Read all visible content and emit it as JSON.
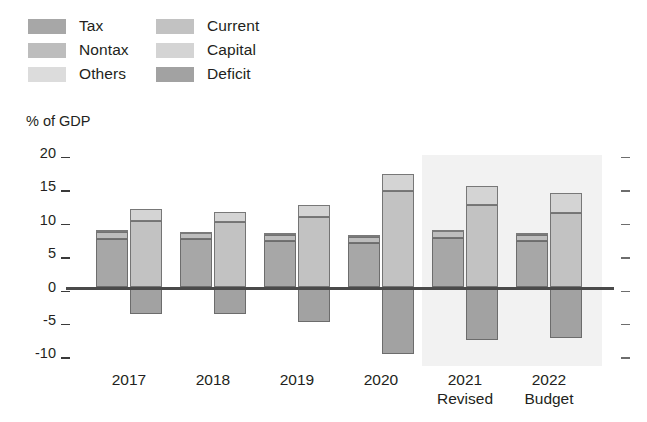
{
  "legend": {
    "columns": [
      {
        "items": [
          {
            "label": "Tax",
            "color": "#a7a7a7"
          },
          {
            "label": "Nontax",
            "color": "#bdbdbd"
          },
          {
            "label": "Others",
            "color": "#dcdcdc"
          }
        ]
      },
      {
        "items": [
          {
            "label": "Current",
            "color": "#c2c2c2"
          },
          {
            "label": "Capital",
            "color": "#d4d4d4"
          },
          {
            "label": "Deficit",
            "color": "#a2a2a2"
          }
        ]
      }
    ]
  },
  "axis_title": "% of GDP",
  "chart_data": {
    "type": "bar",
    "title": "",
    "xlabel": "",
    "ylabel": "% of GDP",
    "ylim": [
      -10,
      20
    ],
    "yticks": [
      20,
      15,
      10,
      5,
      0,
      -5,
      -10
    ],
    "ytick_labels": [
      "20",
      "15",
      "10",
      "5",
      "0",
      "-5",
      "-10"
    ],
    "grid": false,
    "legend_position": "top-left",
    "categories": [
      "2017",
      "2018",
      "2019",
      "2020",
      "2021",
      "2022"
    ],
    "category_sublabels": [
      "",
      "",
      "",
      "",
      "Revised",
      "Budget"
    ],
    "forecast_shaded_categories": [
      "2021",
      "2022"
    ],
    "series": [
      {
        "name": "Tax",
        "group": "revenue",
        "color": "#a7a7a7",
        "values": [
          7.3,
          7.2,
          6.9,
          6.6,
          7.4,
          7.0
        ]
      },
      {
        "name": "Nontax",
        "group": "revenue",
        "color": "#bdbdbd",
        "values": [
          1.0,
          0.9,
          0.9,
          1.0,
          1.0,
          0.9
        ]
      },
      {
        "name": "Others",
        "group": "revenue",
        "color": "#dcdcdc",
        "values": [
          0.3,
          0.2,
          0.3,
          0.2,
          0.2,
          0.2
        ]
      },
      {
        "name": "Current",
        "group": "expenditure",
        "color": "#c2c2c2",
        "values": [
          9.9,
          9.8,
          10.6,
          14.5,
          12.4,
          11.1
        ]
      },
      {
        "name": "Capital",
        "group": "expenditure",
        "color": "#d4d4d4",
        "values": [
          1.8,
          1.5,
          1.7,
          2.5,
          2.8,
          3.0
        ]
      },
      {
        "name": "Deficit",
        "group": "deficit",
        "color": "#a2a2a2",
        "values": [
          -3.9,
          -3.9,
          -5.2,
          -10.0,
          -7.8,
          -7.5
        ]
      }
    ],
    "totals": {
      "revenue": [
        8.6,
        8.3,
        8.1,
        7.8,
        8.6,
        8.1
      ],
      "expenditure": [
        11.7,
        11.3,
        12.3,
        17.0,
        15.2,
        14.1
      ],
      "deficit": [
        -3.9,
        -3.9,
        -5.2,
        -10.0,
        -7.8,
        -7.5
      ]
    }
  },
  "colors": {
    "forecast_band": "#f2f2f2",
    "zero_line": "#4a4a4a",
    "tick": "#3a3a3a",
    "text": "#231f20"
  }
}
